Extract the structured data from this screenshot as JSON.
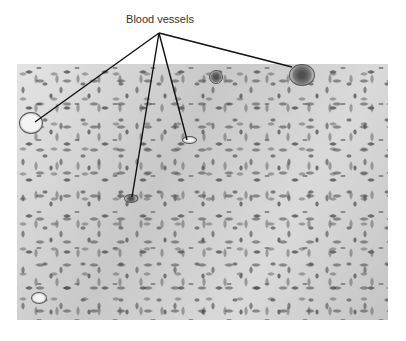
{
  "figure": {
    "label": "Blood vessels",
    "label_anchor": {
      "x": 159,
      "y": 33
    },
    "pointers": [
      {
        "name": "vessel-left",
        "x": 35,
        "y": 122
      },
      {
        "name": "vessel-lower-middle",
        "x": 132,
        "y": 197
      },
      {
        "name": "vessel-middle",
        "x": 187,
        "y": 140
      },
      {
        "name": "vessel-upper-right",
        "x": 292,
        "y": 67
      }
    ],
    "colors": {
      "label_text": "#333333",
      "leader_line": "#111111",
      "tissue_background": "#d2d2d2",
      "nuclei": "#6a6a6a"
    }
  }
}
